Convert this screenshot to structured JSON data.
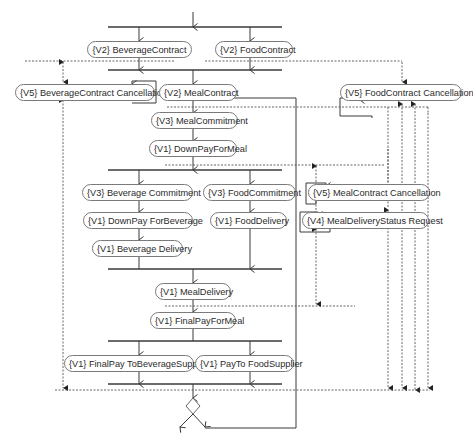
{
  "diagram": {
    "type": "activity-diagram",
    "nodes": {
      "beverage_contract": "{V2} BeverageContract",
      "food_contract": "{V2} FoodContract",
      "beverage_contract_cancellation": "{V5} BeverageContract Cancellation",
      "meal_contract": "{V2}  MealContract",
      "food_contract_cancellation": "{V5} FoodContract Cancellation",
      "meal_commitment": "{V3}  MealCommitment",
      "down_pay_for_meal": "{V1} DownPayForMeal",
      "beverage_commitment": "{V3} Beverage Commitment",
      "food_commitment": "{V3} FoodCommitment",
      "meal_contract_cancellation": "{V5} MealContract Cancellation",
      "down_pay_for_beverage": "{V1} DownPay ForBeverage",
      "food_delivery": "{V1} FoodDelivery",
      "meal_delivery_status_request": "{V4} MealDeliveryStatus Request",
      "beverage_delivery": "{V1} Beverage Delivery",
      "meal_delivery": "{V1} MealDelivery",
      "final_pay_for_meal": "{V1} FinalPayForMeal",
      "final_pay_to_beverage_supplier": "{V1} FinalPay ToBeverageSupplier",
      "pay_to_food_supplier": "{V1} PayTo FoodSupplier"
    },
    "colors": {
      "line": "#3a3a3a",
      "dashed": "#555555",
      "node_border": "#7a7a7a",
      "text": "#2a2a2a",
      "background": "#ffffff"
    }
  }
}
